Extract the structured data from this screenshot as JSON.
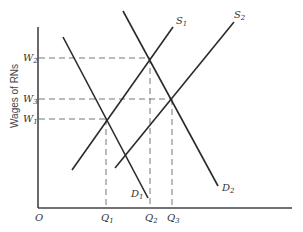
{
  "diagram": {
    "type": "supply-demand",
    "y_axis_label": "Wages of RNs",
    "origin_label": "O",
    "wage_levels": [
      {
        "label": "W",
        "sub": "2",
        "y": 58
      },
      {
        "label": "W",
        "sub": "3",
        "y": 99
      },
      {
        "label": "W",
        "sub": "1",
        "y": 119
      }
    ],
    "quantity_levels": [
      {
        "label": "Q",
        "sub": "1",
        "x": 106
      },
      {
        "label": "Q",
        "sub": "2",
        "x": 150
      },
      {
        "label": "Q",
        "sub": "3",
        "x": 172
      }
    ],
    "curves": [
      {
        "name": "S",
        "sub": "1",
        "kind": "supply"
      },
      {
        "name": "S",
        "sub": "2",
        "kind": "supply"
      },
      {
        "name": "D",
        "sub": "1",
        "kind": "demand"
      },
      {
        "name": "D",
        "sub": "2",
        "kind": "demand"
      }
    ],
    "equilibria": [
      {
        "curves": "D1 × S1",
        "wage": "W1",
        "quantity": "Q1"
      },
      {
        "curves": "D2 × S1",
        "wage": "W2",
        "quantity": "Q2"
      },
      {
        "curves": "D2 × S2",
        "wage": "W3",
        "quantity": "Q3"
      }
    ]
  }
}
